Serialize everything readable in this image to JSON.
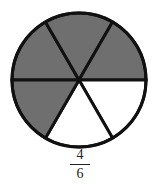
{
  "diagram": {
    "type": "fraction-circle",
    "total_parts": 6,
    "shaded_parts": 4,
    "shaded_color": "#6f6f6f",
    "unshaded_color": "#ffffff",
    "stroke_color": "#111111",
    "fraction": {
      "numerator": "4",
      "denominator": "6"
    }
  }
}
